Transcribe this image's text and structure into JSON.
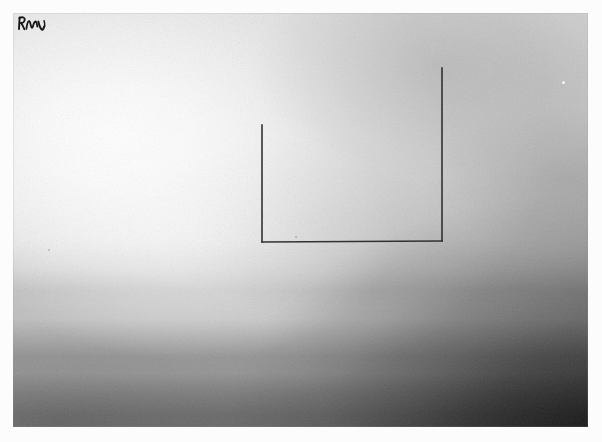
{
  "artwork": {
    "title": "Untitled (open rectangle on tonal ground)",
    "medium_appearance": "graphite / ink line drawing on washed grey ground",
    "orientation": "landscape",
    "plate": {
      "x": 13,
      "y": 13,
      "width": 575,
      "height": 414,
      "margin_color": "#fcfcfc",
      "lightest_tone": "#ffffff",
      "midtone": "#c4c4c4",
      "darkest_tone": "#3a3a3a",
      "light_source_corner": "upper-left",
      "dark_corner": "lower-right"
    },
    "signature": {
      "label": "artist-signature",
      "text": "RmV",
      "position": "top-left",
      "x": 22,
      "y": 26,
      "color": "#1a1a1a"
    },
    "figure": {
      "label": "open-rectangle",
      "description": "Three-sided rectangle: left vertical, bottom horizontal, right vertical. Top side absent.",
      "stroke_color": "#2a2a2a",
      "stroke_width": 1.6,
      "sides": [
        {
          "name": "left-vertical",
          "x1": 249,
          "y1": 112,
          "x2": 249,
          "y2": 229
        },
        {
          "name": "bottom-horizontal",
          "x1": 249,
          "y1": 229,
          "x2": 429,
          "y2": 228
        },
        {
          "name": "right-vertical",
          "x1": 429,
          "y1": 228,
          "x2": 429,
          "y2": 55
        }
      ],
      "top_left_corner": {
        "x": 249,
        "y": 112
      },
      "bottom_left_corner": {
        "x": 249,
        "y": 229
      },
      "bottom_right_corner": {
        "x": 429,
        "y": 228
      },
      "top_right_corner": {
        "x": 429,
        "y": 55
      },
      "width": 180,
      "left_height": 117,
      "right_height": 173
    },
    "blemishes": [
      {
        "name": "light-speck-right",
        "x": 562,
        "y": 81,
        "tone": "light"
      },
      {
        "name": "dark-fleck-left",
        "x": 48,
        "y": 249,
        "tone": "dark"
      },
      {
        "name": "dark-fleck-lower",
        "x": 295,
        "y": 236,
        "tone": "dark"
      }
    ]
  },
  "tonal_profile": {
    "description": "Continuous wash, brightest upper-left, darkening through soft horizontal bands toward a near-black lower-right corner.",
    "bands": [
      {
        "name": "upper-field",
        "top_pct": 0,
        "bottom_pct": 52,
        "tone": "#eeeeee"
      },
      {
        "name": "mid-haze",
        "top_pct": 52,
        "bottom_pct": 70,
        "tone": "#c9c9c9"
      },
      {
        "name": "lower-band",
        "top_pct": 70,
        "bottom_pct": 86,
        "tone": "#9d9d9d"
      },
      {
        "name": "base-shadow",
        "top_pct": 86,
        "bottom_pct": 100,
        "tone": "#5a5a5a"
      }
    ]
  }
}
